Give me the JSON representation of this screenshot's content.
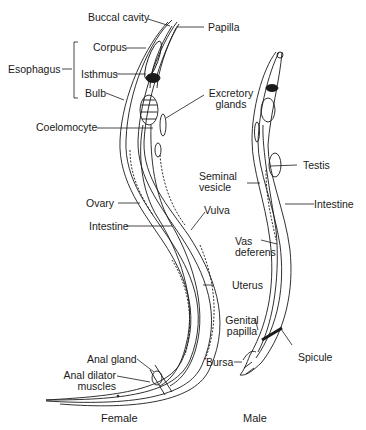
{
  "diagram": {
    "subjects": [
      "Female",
      "Male"
    ],
    "female_labels": {
      "buccal_cavity": "Buccal cavity",
      "papilla": "Papilla",
      "esophagus": "Esophagus",
      "corpus": "Corpus",
      "isthmus": "Isthmus",
      "bulb": "Bulb",
      "coelomocyte": "Coelomocyte",
      "excretory": "Excretory",
      "glands": "glands",
      "ovary": "Ovary",
      "intestine": "Intestine",
      "vulva": "Vulva",
      "uterus": "Uterus",
      "anal_gland": "Anal gland",
      "anal_dilator": "Anal dilator",
      "muscles": "muscles"
    },
    "male_labels": {
      "seminal": "Seminal",
      "vesicle": "vesicle",
      "testis": "Testis",
      "intestine": "Intestine",
      "vas": "Vas",
      "deferens": "deferens",
      "genital": "Genital",
      "papilla": "papilla",
      "bursa": "Bursa",
      "spicule": "Spicule"
    },
    "captions": {
      "female": "Female",
      "male": "Male"
    },
    "colors": {
      "ink": "#1a1a1a",
      "background": "#ffffff"
    }
  }
}
